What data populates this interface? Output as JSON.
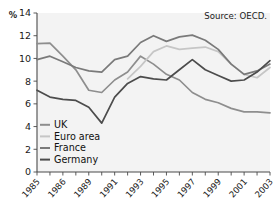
{
  "chart_data": {
    "type": "line",
    "title": "",
    "subtitle": "",
    "xlabel": "",
    "ylabel": "%",
    "ylim": [
      0,
      14
    ],
    "xlim": [
      1985,
      2003
    ],
    "yticks": [
      "0",
      "2",
      "4",
      "6",
      "8",
      "10",
      "12",
      "14"
    ],
    "ytick_values": [
      0,
      2,
      4,
      6,
      8,
      10,
      12,
      14
    ],
    "x": [
      1985,
      1986,
      1987,
      1988,
      1989,
      1990,
      1991,
      1992,
      1993,
      1994,
      1995,
      1996,
      1997,
      1998,
      1999,
      2000,
      2001,
      2002,
      2003
    ],
    "xtick_labels": [
      "1985",
      "1986",
      "1989",
      "1991",
      "1993",
      "1995",
      "1997",
      "1999",
      "2001",
      "2003"
    ],
    "xtick_values": [
      1985,
      1987,
      1989,
      1991,
      1993,
      1995,
      1997,
      1999,
      2001,
      2003
    ],
    "grid": false,
    "legend_position": "inside-bottom-left",
    "annotations": [
      {
        "text": "Source: OECD.",
        "position": "top-right"
      }
    ],
    "series": [
      {
        "name": "UK",
        "color": "#8e8e8e",
        "values": [
          11.3,
          11.35,
          10.2,
          9.0,
          7.2,
          7.0,
          8.1,
          8.8,
          10.2,
          9.5,
          8.6,
          8.1,
          7.0,
          6.4,
          6.1,
          5.6,
          5.3,
          5.3,
          5.2
        ]
      },
      {
        "name": "Euro area",
        "color": "#c6c6c6",
        "values": [
          null,
          null,
          null,
          null,
          null,
          null,
          null,
          8.2,
          9.3,
          10.6,
          11.1,
          10.8,
          10.9,
          11.0,
          10.6,
          9.5,
          8.6,
          8.3,
          9.2
        ]
      },
      {
        "name": "France",
        "color": "#7a7a7a",
        "values": [
          9.9,
          10.2,
          9.7,
          9.2,
          8.9,
          8.8,
          9.9,
          10.2,
          11.4,
          12.0,
          11.5,
          11.9,
          12.05,
          11.6,
          10.8,
          9.5,
          8.6,
          8.9,
          9.5
        ]
      },
      {
        "name": "Germany",
        "color": "#4c4c4c",
        "values": [
          7.2,
          6.6,
          6.4,
          6.3,
          5.7,
          4.3,
          6.6,
          7.8,
          8.4,
          8.2,
          8.1,
          9.0,
          9.9,
          9.0,
          8.5,
          8.0,
          8.1,
          8.8,
          9.8
        ]
      }
    ]
  },
  "axis": {
    "unit_label": "%"
  },
  "source": {
    "text": "Source: OECD."
  },
  "legend": {
    "items": [
      {
        "label": "UK"
      },
      {
        "label": "Euro area"
      },
      {
        "label": "France"
      },
      {
        "label": "Germany"
      }
    ]
  },
  "colors": {
    "uk": "#8e8e8e",
    "euro_area": "#c6c6c6",
    "france": "#7a7a7a",
    "germany": "#4c4c4c",
    "axis": "#4a4a4a",
    "plot_background": "#f3f3f3",
    "text": "#1a1a1a"
  }
}
